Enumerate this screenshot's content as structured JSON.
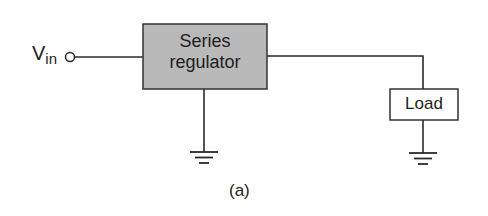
{
  "diagram": {
    "input": {
      "symbol": "V",
      "subscript": "in"
    },
    "blocks": [
      {
        "id": "series-regulator",
        "line1": "Series",
        "line2": "regulator",
        "fill": "#b9b9b9"
      },
      {
        "id": "load",
        "label": "Load",
        "fill": "#ffffff"
      }
    ],
    "caption": "(a)",
    "colors": {
      "wire": "#2a2a2a",
      "regulator_fill": "#b9b9b9"
    }
  }
}
